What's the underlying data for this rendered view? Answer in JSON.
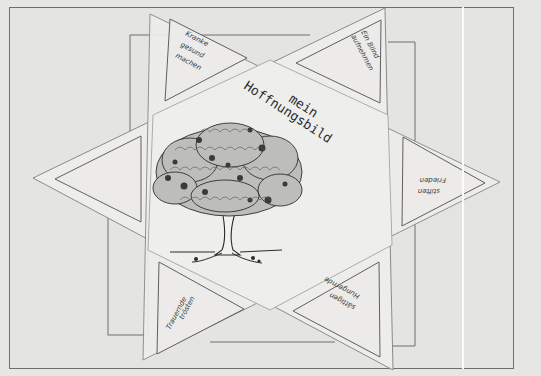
{
  "image": {
    "title_line1": "mein",
    "title_line2": "Hoffnungsbild",
    "illustration": "tree-icon",
    "colors": {
      "background": "#e4e4e2",
      "paper": "#ececea",
      "line": "#6f6f6f",
      "ink": "#2a2a2a"
    }
  },
  "triangles": [
    {
      "position": "top-left",
      "line1": "Kranke",
      "line2": "gesund",
      "line3": "machen"
    },
    {
      "position": "top-right",
      "line1": "Ein Blind",
      "line2": "aufnehmen"
    },
    {
      "position": "right",
      "line1": "Frieden",
      "line2": "stiften"
    },
    {
      "position": "bottom-right",
      "line1": "Hungernde",
      "line2": "sättigen"
    },
    {
      "position": "bottom-left",
      "line1": "Trauernde",
      "line2": "trösten"
    },
    {
      "position": "left",
      "line1": ""
    }
  ]
}
